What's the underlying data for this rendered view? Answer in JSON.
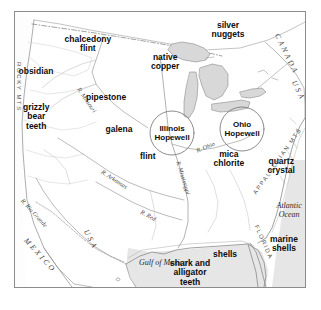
{
  "map": {
    "title": "Hopewell Interaction Sphere trade goods map of North America",
    "frame": {
      "stroke": "#8c8c8c",
      "background": "#ffffff"
    },
    "colors": {
      "coastline": "#8a8a8a",
      "river": "#9a9a9a",
      "lake_fill": "#d9d9d9",
      "ocean_fill": "#e2e2e2",
      "label": "#0d0d0d",
      "geo_label": "#5a5a5a"
    },
    "resource_labels": [
      {
        "text": "chalcedony\nflint",
        "x": 88,
        "y": 44
      },
      {
        "text": "obsidian",
        "x": 36,
        "y": 71
      },
      {
        "text": "native\ncopper",
        "x": 165,
        "y": 62
      },
      {
        "text": "silver\nnuggets",
        "x": 228,
        "y": 30
      },
      {
        "text": "pipestone",
        "x": 106,
        "y": 97
      },
      {
        "text": "grizzly\nbear\nteeth",
        "x": 36,
        "y": 117
      },
      {
        "text": "galena",
        "x": 119,
        "y": 129
      },
      {
        "text": "flint",
        "x": 148,
        "y": 156
      },
      {
        "text": "mica\nchlorite",
        "x": 229,
        "y": 159
      },
      {
        "text": "quartz\ncrystal",
        "x": 281,
        "y": 166
      },
      {
        "text": "shells",
        "x": 225,
        "y": 254
      },
      {
        "text": "marine\nshells",
        "x": 284,
        "y": 244
      },
      {
        "text": "shark and\nalligator\nteeth",
        "x": 190,
        "y": 273
      }
    ],
    "hopewell_circles": [
      {
        "label": "Illinois\nHopewell",
        "cx": 172,
        "cy": 133,
        "r": 22
      },
      {
        "label": "Ohio\nHopewell",
        "cx": 242,
        "cy": 129,
        "r": 22
      }
    ],
    "water_bodies": [
      {
        "text": "Atlantic\nOcean",
        "x": 289,
        "y": 210
      },
      {
        "text": "Gulf of Mexico",
        "x": 163,
        "y": 262
      }
    ],
    "rivers": [
      {
        "text": "R. Missouri",
        "x": 82,
        "y": 86,
        "rotate": 56
      },
      {
        "text": "R. Arkansas",
        "x": 104,
        "y": 168,
        "rotate": 33
      },
      {
        "text": "R. Mississippi",
        "x": 182,
        "y": 160,
        "rotate": 73
      },
      {
        "text": "R. Red",
        "x": 143,
        "y": 208,
        "rotate": 29
      },
      {
        "text": "R. Ohio",
        "x": 195,
        "y": 147,
        "rotate": -22
      },
      {
        "text": "R. Rio Grande",
        "x": 25,
        "y": 197,
        "rotate": 48
      }
    ],
    "geographic_features": [
      {
        "text": "ROCKY MTS",
        "x": 22,
        "y": 62,
        "rotate": 90
      },
      {
        "text": "APPALACHIAN MTS",
        "x": 252,
        "y": 192,
        "rotate": -55
      },
      {
        "text": "FLORIDA",
        "x": 259,
        "y": 224,
        "rotate": 66
      }
    ],
    "countries": [
      {
        "text": "CANADA",
        "x": 281,
        "y": 32,
        "rotate": 64
      },
      {
        "text": "USA",
        "x": 298,
        "y": 79,
        "rotate": 64
      },
      {
        "text": "MEXICO",
        "x": 29,
        "y": 236,
        "rotate": 48
      },
      {
        "text": "USA",
        "x": 90,
        "y": 228,
        "rotate": 62
      }
    ]
  }
}
